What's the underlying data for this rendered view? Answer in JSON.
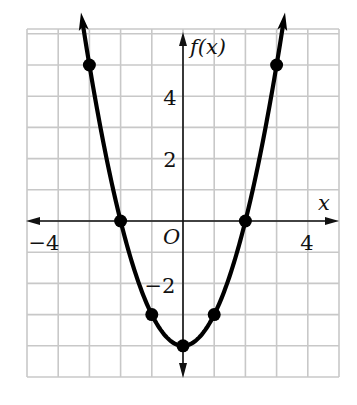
{
  "chart_data": {
    "type": "line",
    "title": "",
    "function": "f(x) = x^2 - 4",
    "xlabel": "x",
    "ylabel": "f(x)",
    "origin_label": "O",
    "xlim": [
      -5,
      5
    ],
    "ylim": [
      -5,
      6
    ],
    "grid": true,
    "grid_step": 1,
    "x_tick_labels": [
      {
        "value": -4,
        "label": "−4"
      },
      {
        "value": 4,
        "label": "4"
      }
    ],
    "y_tick_labels": [
      {
        "value": 4,
        "label": "4"
      },
      {
        "value": 2,
        "label": "2"
      },
      {
        "value": -2,
        "label": "−2"
      }
    ],
    "series": [
      {
        "name": "f(x)",
        "x": [
          -3,
          -2,
          -1,
          0,
          1,
          2,
          3
        ],
        "y": [
          5,
          0,
          -3,
          -4,
          -3,
          0,
          5
        ],
        "marked_points": true,
        "arrows_at_ends": true
      }
    ],
    "colors": {
      "curve": "#000000",
      "grid": "#c8c8c8",
      "axis": "#111111"
    }
  }
}
